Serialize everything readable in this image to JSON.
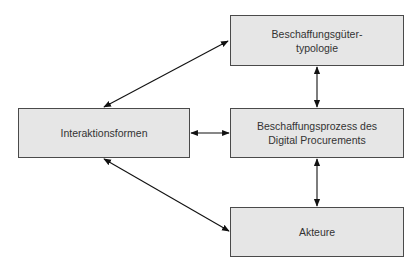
{
  "diagram": {
    "nodes": [
      {
        "id": "typology",
        "lines": [
          "Beschaffungsgüter-",
          "typologie"
        ]
      },
      {
        "id": "process",
        "lines": [
          "Beschaffungsprozess des",
          "Digital Procurements"
        ]
      },
      {
        "id": "interaction",
        "lines": [
          "Interaktionsformen"
        ]
      },
      {
        "id": "actors",
        "lines": [
          "Akteure"
        ]
      }
    ],
    "edges": [
      {
        "from": "interaction",
        "to": "typology",
        "direction": "bidirectional"
      },
      {
        "from": "interaction",
        "to": "process",
        "direction": "bidirectional"
      },
      {
        "from": "interaction",
        "to": "actors",
        "direction": "bidirectional"
      },
      {
        "from": "typology",
        "to": "process",
        "direction": "bidirectional"
      },
      {
        "from": "process",
        "to": "actors",
        "direction": "bidirectional"
      }
    ],
    "colors": {
      "box_fill": "#e6e6e6",
      "box_border": "#4a4a4a",
      "arrow": "#111111",
      "text": "#333333"
    }
  }
}
